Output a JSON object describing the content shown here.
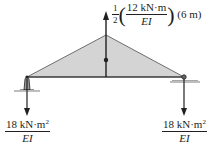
{
  "diagram": {
    "type": "conjugate-beam-loading",
    "load_shape": "triangle",
    "colors": {
      "fill": "#d4d4d4",
      "line": "#231f20"
    },
    "resultant_label": {
      "coefficient_num": "1",
      "coefficient_den": "2",
      "value_num": "12 kN·m",
      "value_den": "EI",
      "length": "(6 m)"
    },
    "left_reaction": {
      "num": "18 kN·m",
      "exp": "2",
      "den": "EI"
    },
    "right_reaction": {
      "num": "18 kN·m",
      "exp": "2",
      "den": "EI"
    }
  }
}
